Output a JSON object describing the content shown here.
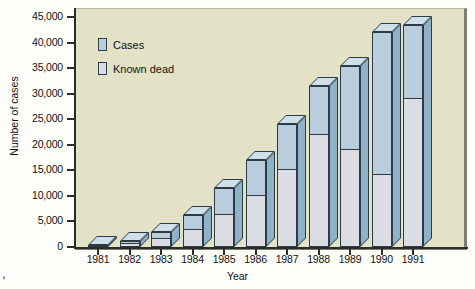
{
  "chart_data": {
    "type": "bar",
    "title": "",
    "xlabel": "Year",
    "ylabel": "Number of cases",
    "categories": [
      "1981",
      "1982",
      "1983",
      "1984",
      "1985",
      "1986",
      "1987",
      "1988",
      "1989",
      "1990",
      "1991"
    ],
    "series": [
      {
        "name": "Cases",
        "values": [
          300,
          1200,
          3000,
          6200,
          11500,
          17000,
          24000,
          31500,
          35500,
          42000,
          43500
        ]
      },
      {
        "name": "Known dead",
        "values": [
          150,
          600,
          1500,
          3300,
          6300,
          10000,
          15000,
          22000,
          19000,
          14000,
          29000
        ]
      }
    ],
    "ylim": [
      0,
      45000
    ],
    "yticks": [
      0,
      5000,
      10000,
      15000,
      20000,
      25000,
      30000,
      35000,
      40000,
      45000
    ],
    "ytick_labels": [
      "0",
      "5,000",
      "10,000",
      "15,000",
      "20,000",
      "25,000",
      "30,000",
      "35,000",
      "40,000",
      "45,000"
    ],
    "grid": false,
    "legend_position": "top-left",
    "legend": [
      "Cases",
      "Known dead"
    ],
    "colors": {
      "cases_face": "#b9cddc",
      "cases_side": "#8fb2c7",
      "cases_top": "#cfe0ea",
      "known_dead_face": "#dcdde4",
      "plot_background": "#e4e2c6",
      "outline": "#2d3b45",
      "axis": "#2b2b2b",
      "page_background": "#fdfdfa"
    }
  },
  "legend": {
    "items": [
      {
        "label": "Cases",
        "swatch_name": "legend-swatch-cases"
      },
      {
        "label": "Known dead",
        "swatch_name": "legend-swatch-known-dead"
      }
    ]
  },
  "axes": {
    "y_title": "Number of cases",
    "x_title": "Year"
  },
  "marks": {
    "corner_glyph": ","
  }
}
